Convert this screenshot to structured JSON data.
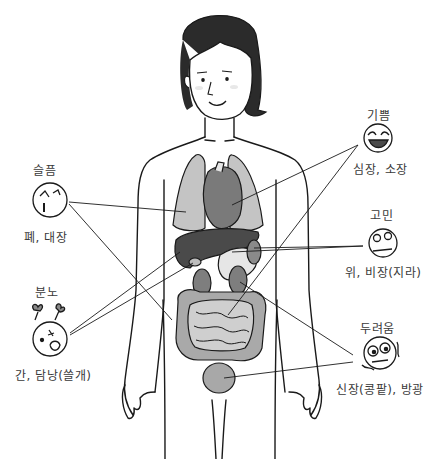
{
  "diagram": {
    "emotions": [
      {
        "id": "sadness",
        "label": "슬픔",
        "organs": "폐, 대장",
        "face": "crying-face"
      },
      {
        "id": "anger",
        "label": "분노",
        "organs": "간, 담낭(쓸개)",
        "face": "angry-face"
      },
      {
        "id": "joy",
        "label": "기쁨",
        "organs": "심장, 소장",
        "face": "laughing-face"
      },
      {
        "id": "worry",
        "label": "고민",
        "organs": "위, 비장(지라)",
        "face": "worried-face"
      },
      {
        "id": "fear",
        "label": "두려움",
        "organs": "신장(콩팥), 방광",
        "face": "scared-face"
      }
    ],
    "colors": {
      "line": "#1a1a1a",
      "hair": "#2b2b2b",
      "lung": "#c4c4c4",
      "heart": "#7a7a7a",
      "liver": "#4a4a4a",
      "stomach": "#e6e6e6",
      "kidney": "#7e7e7e",
      "intestine_large": "#a9a9a9",
      "intestine_small": "#cfcfcf",
      "bladder": "#a8a8a8"
    }
  }
}
